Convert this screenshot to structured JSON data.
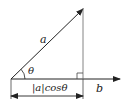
{
  "diagram": {
    "title": "",
    "labels": {
      "vector_a": "a",
      "vector_b": "b",
      "angle": "θ",
      "projection": "|a|cosθ"
    },
    "colors": {
      "line": "#222222",
      "background": "#ffffff"
    },
    "elements": [
      {
        "type": "arrow",
        "name": "vector-a",
        "from": [
          11,
          79
        ],
        "to": [
          83,
          9
        ]
      },
      {
        "type": "arrow",
        "name": "vector-b",
        "from": [
          11,
          79
        ],
        "to": [
          120,
          79
        ]
      },
      {
        "type": "line",
        "name": "perpendicular",
        "from": [
          83,
          9
        ],
        "to": [
          83,
          79
        ]
      },
      {
        "type": "right-angle-marker",
        "at": [
          83,
          79
        ],
        "size": 6
      },
      {
        "type": "angle-arc",
        "at": [
          11,
          79
        ],
        "label": "θ"
      },
      {
        "type": "dimension-line",
        "from": [
          11,
          95
        ],
        "to": [
          83,
          95
        ],
        "label": "|a|cosθ"
      }
    ]
  }
}
